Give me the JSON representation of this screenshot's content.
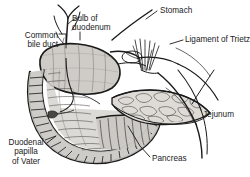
{
  "figure": {
    "type": "medical-anatomical-diagram",
    "background_color": "#ffffff",
    "ink_color": "#1a1a1a",
    "fill_light": "#d8d6d3",
    "fill_mid": "#b3b0ac",
    "fill_dark": "#8a8782"
  },
  "labels": [
    {
      "id": "common-bile-duct",
      "text": "Common\nbile duct",
      "x": 8,
      "y": 31,
      "align": "left"
    },
    {
      "id": "bulb-of-duodenum",
      "text": "Bulb of\nduodenum",
      "x": 72,
      "y": 14,
      "align": "left"
    },
    {
      "id": "stomach",
      "text": "Stomach",
      "x": 160,
      "y": 8,
      "align": "left"
    },
    {
      "id": "ligament-of-trietz",
      "text": "Ligament of Trietz",
      "x": 185,
      "y": 36,
      "align": "left"
    },
    {
      "id": "jejunum",
      "text": "Jejunum",
      "x": 203,
      "y": 111,
      "align": "left"
    },
    {
      "id": "pancreas",
      "text": "Pancreas",
      "x": 152,
      "y": 155,
      "align": "left"
    },
    {
      "id": "duodenal-papilla-of-vater",
      "text": "Duodenal\npapilla\nof Vater",
      "x": 6,
      "y": 139,
      "align": "center"
    }
  ],
  "structures": [
    {
      "id": "duodenum-c-loop",
      "name": "Duodenum (C-loop)"
    },
    {
      "id": "biliary-tree",
      "name": "Common bile duct and hepatic branches"
    },
    {
      "id": "duodenal-bulb",
      "name": "Duodenal bulb"
    },
    {
      "id": "stomach-outline",
      "name": "Stomach outline"
    },
    {
      "id": "ligament-fibers",
      "name": "Ligament of Trietz suspensory fibers"
    },
    {
      "id": "pancreas-body",
      "name": "Pancreas"
    },
    {
      "id": "jejunum-loop",
      "name": "Jejunum"
    },
    {
      "id": "valvulae-conniventes",
      "name": "Circular mucosal folds"
    }
  ]
}
